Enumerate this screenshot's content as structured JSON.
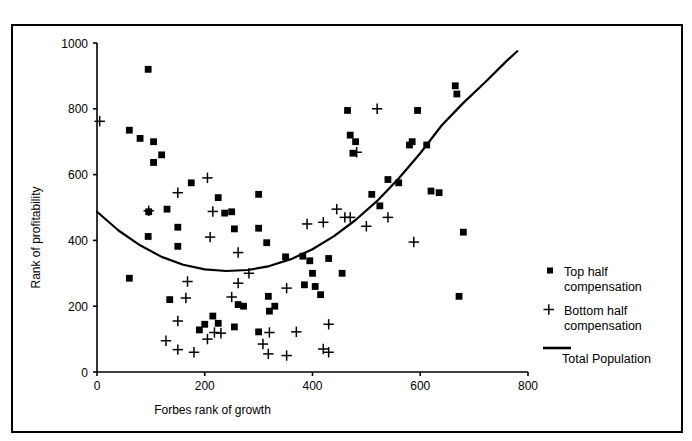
{
  "figure": {
    "title_clipped": "Figure 3. Scatterplot of Forbes rank of growth by rank of profitability",
    "background": "#ffffff",
    "ink_color": "#000000",
    "border_color": "#000000"
  },
  "chart_data": {
    "type": "scatter",
    "title": "",
    "xlabel": "Forbes rank of growth",
    "ylabel": "Rank of profitability",
    "xlim": [
      0,
      800
    ],
    "ylim": [
      0,
      1000
    ],
    "xticks": [
      0,
      200,
      400,
      600,
      800
    ],
    "yticks": [
      0,
      200,
      400,
      600,
      800,
      1000
    ],
    "xtick_labels": [
      "0",
      "200",
      "400",
      "600",
      "800"
    ],
    "ytick_labels": [
      "0",
      "200",
      "400",
      "600",
      "800",
      "1000"
    ],
    "grid": false,
    "legend_position": "right",
    "legend": [
      {
        "label": "Top half compensation",
        "marker": "square"
      },
      {
        "label": "Bottom half compensation",
        "marker": "plus"
      },
      {
        "label": "Total Population",
        "marker": "line"
      }
    ],
    "series": [
      {
        "name": "Top half compensation",
        "marker": "square",
        "color": "#000000",
        "points": [
          [
            95,
            920
          ],
          [
            60,
            735
          ],
          [
            80,
            710
          ],
          [
            105,
            700
          ],
          [
            120,
            660
          ],
          [
            105,
            637
          ],
          [
            175,
            575
          ],
          [
            130,
            495
          ],
          [
            95,
            412
          ],
          [
            150,
            440
          ],
          [
            150,
            382
          ],
          [
            60,
            285
          ],
          [
            225,
            530
          ],
          [
            250,
            487
          ],
          [
            237,
            483
          ],
          [
            300,
            540
          ],
          [
            255,
            435
          ],
          [
            300,
            437
          ],
          [
            315,
            393
          ],
          [
            350,
            350
          ],
          [
            382,
            352
          ],
          [
            395,
            338
          ],
          [
            430,
            345
          ],
          [
            400,
            300
          ],
          [
            455,
            300
          ],
          [
            465,
            795
          ],
          [
            470,
            720
          ],
          [
            480,
            700
          ],
          [
            475,
            665
          ],
          [
            510,
            540
          ],
          [
            525,
            505
          ],
          [
            540,
            585
          ],
          [
            560,
            575
          ],
          [
            580,
            690
          ],
          [
            585,
            700
          ],
          [
            595,
            795
          ],
          [
            612,
            690
          ],
          [
            620,
            550
          ],
          [
            635,
            545
          ],
          [
            665,
            870
          ],
          [
            668,
            845
          ],
          [
            680,
            425
          ],
          [
            672,
            230
          ],
          [
            385,
            265
          ],
          [
            405,
            260
          ],
          [
            415,
            235
          ],
          [
            262,
            205
          ],
          [
            255,
            137
          ],
          [
            215,
            170
          ],
          [
            200,
            145
          ],
          [
            225,
            148
          ],
          [
            272,
            200
          ],
          [
            320,
            185
          ],
          [
            300,
            122
          ],
          [
            190,
            128
          ],
          [
            135,
            220
          ],
          [
            318,
            230
          ],
          [
            330,
            200
          ],
          [
            96,
            487
          ]
        ]
      },
      {
        "name": "Bottom half compensation",
        "marker": "plus",
        "color": "#000000",
        "points": [
          [
            5,
            762
          ],
          [
            96,
            490
          ],
          [
            150,
            545
          ],
          [
            205,
            590
          ],
          [
            215,
            488
          ],
          [
            168,
            275
          ],
          [
            165,
            225
          ],
          [
            150,
            155
          ],
          [
            128,
            95
          ],
          [
            150,
            68
          ],
          [
            180,
            60
          ],
          [
            205,
            100
          ],
          [
            218,
            120
          ],
          [
            262,
            270
          ],
          [
            250,
            228
          ],
          [
            230,
            118
          ],
          [
            308,
            85
          ],
          [
            320,
            120
          ],
          [
            318,
            55
          ],
          [
            352,
            50
          ],
          [
            370,
            122
          ],
          [
            420,
            70
          ],
          [
            430,
            60
          ],
          [
            430,
            145
          ],
          [
            390,
            450
          ],
          [
            420,
            455
          ],
          [
            460,
            470
          ],
          [
            470,
            470
          ],
          [
            445,
            495
          ],
          [
            500,
            443
          ],
          [
            540,
            470
          ],
          [
            520,
            800
          ],
          [
            482,
            668
          ],
          [
            588,
            395
          ],
          [
            262,
            363
          ],
          [
            282,
            300
          ],
          [
            352,
            255
          ],
          [
            210,
            410
          ]
        ]
      }
    ],
    "fit_curve": {
      "name": "Total Population",
      "style": "solid",
      "color": "#000000",
      "description": "U-shaped quadratic trend line for total population",
      "points": [
        [
          0,
          487
        ],
        [
          40,
          430
        ],
        [
          80,
          385
        ],
        [
          120,
          350
        ],
        [
          160,
          326
        ],
        [
          200,
          312
        ],
        [
          240,
          307
        ],
        [
          280,
          310
        ],
        [
          320,
          322
        ],
        [
          360,
          343
        ],
        [
          400,
          373
        ],
        [
          440,
          413
        ],
        [
          480,
          462
        ],
        [
          520,
          520
        ],
        [
          560,
          588
        ],
        [
          600,
          665
        ],
        [
          640,
          750
        ],
        [
          680,
          818
        ],
        [
          720,
          880
        ],
        [
          760,
          945
        ],
        [
          780,
          975
        ]
      ]
    }
  }
}
